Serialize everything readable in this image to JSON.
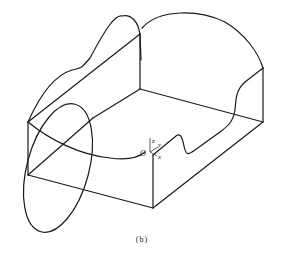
{
  "figure": {
    "caption": "(b)",
    "axes": {
      "origin_label": "O",
      "x_label": "x",
      "y_label": "y",
      "z_label": "z"
    },
    "stroke_color": "#1a1a1a",
    "background": "#ffffff"
  }
}
